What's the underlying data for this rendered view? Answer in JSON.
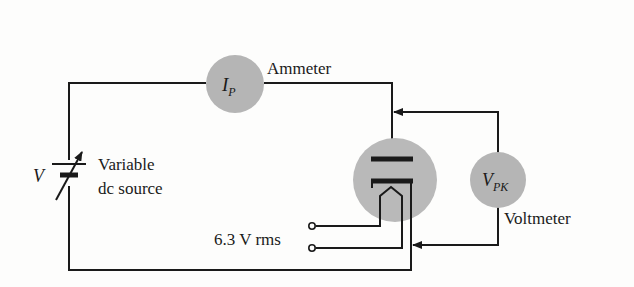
{
  "diagram": {
    "type": "circuit",
    "colors": {
      "wire": "#1a1a1a",
      "meter_fill": "#b5b5b5",
      "tube_fill": "#b9b9b9",
      "background": "#fdfdfc"
    },
    "source": {
      "symbol": "V",
      "label_line1": "Variable",
      "label_line2": "dc source"
    },
    "ammeter": {
      "symbol_main": "I",
      "symbol_sub": "P",
      "label": "Ammeter"
    },
    "voltmeter": {
      "symbol_main": "V",
      "symbol_sub": "PK",
      "label": "Voltmeter"
    },
    "filament": {
      "label": "6.3 V rms"
    },
    "tube": {
      "name": "vacuum-diode",
      "elements": [
        "plate",
        "cathode",
        "heater-filament"
      ]
    }
  }
}
